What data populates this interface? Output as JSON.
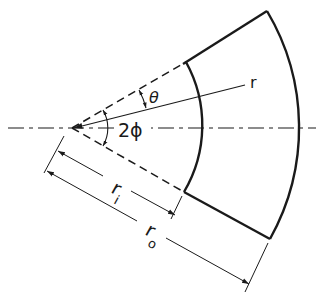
{
  "diagram": {
    "labels": {
      "r": "r",
      "theta": "θ",
      "two_phi": "2ϕ",
      "r_inner": "r",
      "r_inner_sub": "i",
      "r_outer": "r",
      "r_outer_sub": "o"
    },
    "geometry": {
      "apex": [
        72,
        128
      ],
      "inner_radius": 131,
      "outer_radius": 228,
      "half_angle_deg": 30,
      "r_line_angle_deg": -14
    },
    "colors": {
      "line": "#1a1a1a",
      "background": "#ffffff"
    }
  }
}
